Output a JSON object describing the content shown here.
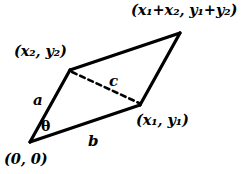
{
  "figure": {
    "canvas": {
      "width": 244,
      "height": 174,
      "background": "#ffffff"
    },
    "stroke_color": "#000000",
    "labels": {
      "sum_vertex": "(x₁+x₂, y₁+y₂)",
      "vector2_vertex": "(x₂, y₂)",
      "vector1_vertex": "(x₁, y₁)",
      "origin_vertex": "(0, 0)",
      "side_a": "a",
      "side_b": "b",
      "diagonal_c": "c",
      "angle_theta": "θ"
    },
    "geometry": {
      "vertices": {
        "origin": [
          30,
          142
        ],
        "v1": [
          140,
          105
        ],
        "v2": [
          70,
          70
        ],
        "sum": [
          180,
          33
        ]
      },
      "solid_edges": [
        {
          "name": "side-a",
          "from": "origin",
          "to": "v2"
        },
        {
          "name": "side-b",
          "from": "origin",
          "to": "v1"
        },
        {
          "name": "edge-v2-sum",
          "from": "v2",
          "to": "sum"
        },
        {
          "name": "edge-v1-sum",
          "from": "v1",
          "to": "sum"
        }
      ],
      "dashed_edges": [
        {
          "name": "diagonal-c",
          "from": "v2",
          "to": "v1"
        }
      ],
      "stroke_width": 3.2,
      "dash_pattern": "5,4"
    }
  }
}
